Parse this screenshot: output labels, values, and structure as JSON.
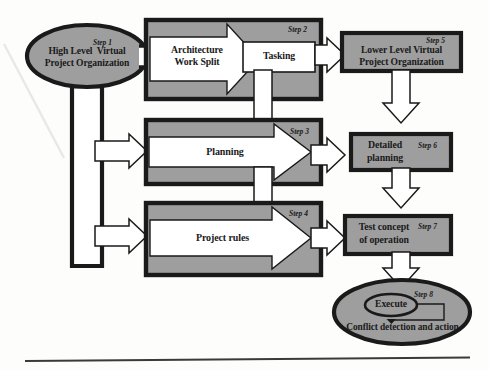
{
  "diagram": {
    "colors": {
      "fill_gray": "#9e9e9e",
      "fill_white": "#ffffff",
      "stroke_dark": "#1a1a1a",
      "page_bg": "#fdfdfc"
    },
    "nodes": {
      "step1": {
        "step_label": "Step 1",
        "line1": "High Level  Virtual",
        "line2": "Project Organization",
        "shape": "ellipse"
      },
      "step2": {
        "step_label": "Step 2",
        "arrow_line1": "Architecture",
        "arrow_line2": "Work Split",
        "sub_box_label": "Tasking",
        "shape": "box-with-arrow"
      },
      "step3": {
        "step_label": "Step 3",
        "arrow_label": "Planning",
        "shape": "box-with-arrow"
      },
      "step4": {
        "step_label": "Step 4",
        "arrow_label": "Project rules",
        "shape": "box-with-arrow"
      },
      "step5": {
        "step_label": "Step 5",
        "line1": "Lower Level Virtual",
        "line2": "Project Organization",
        "shape": "rectangle"
      },
      "step6": {
        "step_label": "Step 6",
        "line1": "Detailed",
        "line2": "planning",
        "shape": "rectangle"
      },
      "step7": {
        "step_label": "Step 7",
        "line1": "Test concept",
        "line2": "of operation",
        "shape": "rectangle"
      },
      "step8": {
        "step_label": "Step 8",
        "inner_label": "Execute",
        "caption": "Conflict detection and action",
        "shape": "ellipse"
      }
    },
    "connectors": [
      {
        "name": "step1-to-step2",
        "from": "step1",
        "to": "step2",
        "kind": "hollow-link",
        "direction": "right"
      },
      {
        "name": "step1-trunk-down",
        "from": "step1",
        "to": "left-bus",
        "kind": "hollow-channel",
        "direction": "down"
      },
      {
        "name": "left-bus-to-step3",
        "from": "left-bus",
        "to": "step3",
        "kind": "block-arrow",
        "direction": "right"
      },
      {
        "name": "left-bus-to-step4",
        "from": "left-bus",
        "to": "step4",
        "kind": "block-arrow",
        "direction": "right"
      },
      {
        "name": "step2-to-step5",
        "from": "step2",
        "to": "step5",
        "kind": "block-arrow",
        "direction": "right"
      },
      {
        "name": "step2-to-step3",
        "from": "step2",
        "to": "step3",
        "kind": "block-arrow",
        "direction": "down"
      },
      {
        "name": "step3-to-step6",
        "from": "step3",
        "to": "step6",
        "kind": "block-arrow",
        "direction": "right"
      },
      {
        "name": "step3-to-step4",
        "from": "step3",
        "to": "step4",
        "kind": "block-arrow",
        "direction": "down"
      },
      {
        "name": "step4-to-step7",
        "from": "step4",
        "to": "step7",
        "kind": "block-arrow",
        "direction": "right"
      },
      {
        "name": "step5-to-step6",
        "from": "step5",
        "to": "step6",
        "kind": "block-arrow",
        "direction": "down"
      },
      {
        "name": "step6-to-step7",
        "from": "step6",
        "to": "step7",
        "kind": "block-arrow",
        "direction": "down"
      },
      {
        "name": "step7-to-step8",
        "from": "step7",
        "to": "step8",
        "kind": "block-arrow",
        "direction": "down"
      },
      {
        "name": "step8-feedback-loop",
        "from": "step8",
        "to": "step8",
        "kind": "thin-line-arrow",
        "direction": "loop"
      }
    ],
    "footer_rule": {
      "name": "horizontal-rule"
    }
  }
}
